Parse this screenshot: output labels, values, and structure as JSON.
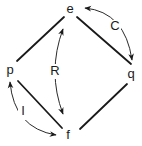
{
  "diagram": {
    "nodes": {
      "e": {
        "label": "e",
        "x": 70,
        "y": 10
      },
      "p": {
        "label": "p",
        "x": 10,
        "y": 71
      },
      "q": {
        "label": "q",
        "x": 131,
        "y": 75
      },
      "f": {
        "label": "f",
        "x": 68,
        "y": 136
      }
    },
    "edges": [
      {
        "from": "e",
        "to": "p"
      },
      {
        "from": "e",
        "to": "q"
      },
      {
        "from": "p",
        "to": "f"
      },
      {
        "from": "q",
        "to": "f"
      }
    ],
    "relations": {
      "R": {
        "label": "R",
        "between": [
          "e",
          "f"
        ],
        "x": 55,
        "y": 72
      },
      "C": {
        "label": "C",
        "between": [
          "e",
          "q"
        ],
        "x": 115,
        "y": 27
      },
      "I": {
        "label": "I",
        "between": [
          "p",
          "f"
        ],
        "x": 23,
        "y": 112
      }
    },
    "colors": {
      "ink": "#1a1a1a",
      "background": "#ffffff"
    }
  }
}
